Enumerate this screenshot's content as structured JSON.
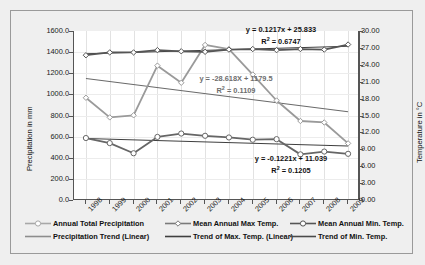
{
  "chart_data": {
    "type": "line",
    "title": "",
    "xlabel": "",
    "ylabel": "Precipitation in mm",
    "ylabel_secondary": "Temperature in °C",
    "categories": [
      "1998",
      "1999",
      "2000",
      "2001",
      "2002",
      "2003",
      "2004",
      "2005",
      "2006",
      "2007",
      "2008",
      "2009"
    ],
    "ylim": [
      0,
      1600
    ],
    "ylim_secondary": [
      0,
      30
    ],
    "yticks": [
      "0.0",
      "200.0",
      "400.0",
      "600.0",
      "800.0",
      "1000.0",
      "1200.0",
      "1400.0",
      "1600.0"
    ],
    "yticks_secondary": [
      "0.00",
      "3.00",
      "6.00",
      "9.00",
      "12.00",
      "15.00",
      "18.00",
      "21.00",
      "24.00",
      "27.00",
      "30.00"
    ],
    "grid": true,
    "legend_position": "bottom",
    "series": [
      {
        "name": "Annual Total Precipitation",
        "axis": "left",
        "marker": "open-diamond",
        "color": "#9a9a9a",
        "values": [
          968,
          782,
          802,
          1272,
          1110,
          1468,
          1428,
          1188,
          942,
          748,
          734,
          536
        ]
      },
      {
        "name": "Mean Annual Max Temp.",
        "axis": "right",
        "marker": "open-diamond",
        "color": "#555555",
        "values": [
          25.7,
          26.2,
          26.2,
          26.6,
          26.4,
          26.3,
          26.7,
          26.8,
          26.6,
          26.8,
          26.7,
          27.6
        ]
      },
      {
        "name": "Mean Annual Min. Temp.",
        "axis": "right",
        "marker": "open-circle",
        "color": "#666666",
        "values": [
          11.0,
          10.1,
          8.3,
          11.2,
          11.8,
          11.4,
          11.1,
          10.7,
          10.8,
          8.1,
          8.6,
          8.2
        ]
      }
    ],
    "trendlines": [
      {
        "name": "Trend of Max. Temp. (Linear)",
        "axis": "right",
        "equation": "y = 0.1217x + 25.833",
        "r_squared": "R² = 0.6747",
        "slope": 0.1217,
        "intercept": 25.833,
        "color": "#3f3f3f"
      },
      {
        "name": "Precipitation Trend (Linear)",
        "axis": "left",
        "equation": "y = -28.618X + 1179.5",
        "r_squared": "R² = 0.1109",
        "slope": -28.618,
        "intercept": 1179.5,
        "color": "#6a6a6a"
      },
      {
        "name": "Trend of Min. Temp.",
        "axis": "right",
        "equation": "y = -0.1221x + 11.039",
        "r_squared": "R² = 0.1205",
        "slope": -0.1221,
        "intercept": 11.039,
        "color": "#3f3f3f"
      }
    ]
  },
  "axes": {
    "left_title": "Precipitation in mm",
    "right_title": "Temperature in °C"
  },
  "annotations": {
    "max_temp_eq": "y = 0.1217x + 25.833",
    "max_temp_r2_pre": "R",
    "max_temp_r2_sup": "2",
    "max_temp_r2_post": " = 0.6747",
    "precip_eq": "y = -28.618X + 1179.5",
    "precip_r2_pre": "R",
    "precip_r2_sup": "2",
    "precip_r2_post": " = 0.1109",
    "min_temp_eq": "y = -0.1221x + 11.039",
    "min_temp_r2_pre": "R",
    "min_temp_r2_sup": "2",
    "min_temp_r2_post": " = 0.1205"
  },
  "legend": {
    "items": [
      {
        "label": "Annual Total Precipitation",
        "marker": "open-circle",
        "color": "#a8a8a8"
      },
      {
        "label": "Mean Annual Max Temp.",
        "marker": "open-diamond",
        "color": "#7a7a7a"
      },
      {
        "label": "Mean Annual Min. Temp.",
        "marker": "open-circle",
        "color": "#555555"
      },
      {
        "label": "Precipitation Trend (Linear)",
        "marker": "line",
        "color": "#8d8d8d"
      },
      {
        "label": "Trend of Max. Temp. (Linear)",
        "marker": "line",
        "color": "#3f3f3f"
      },
      {
        "label": "Trend of Min. Temp.",
        "marker": "line",
        "color": "#4a4a4a"
      }
    ]
  },
  "colors": {
    "background": "#efefef",
    "plot_background": "#ffffff",
    "axis": "#555555",
    "grid": "#e2e2e2",
    "precipitation": "#9a9a9a",
    "max_temp": "#555555",
    "min_temp": "#666666"
  }
}
